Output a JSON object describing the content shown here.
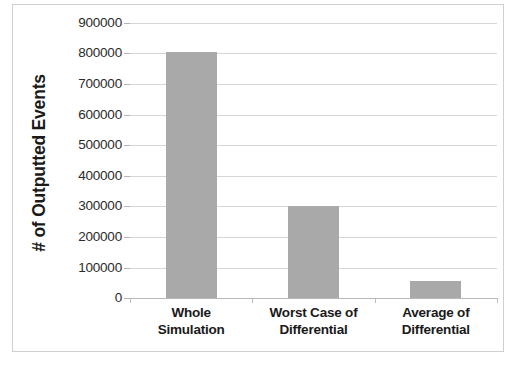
{
  "chart_data": {
    "type": "bar",
    "title": "",
    "xlabel": "",
    "ylabel": "# of Outputted Events",
    "categories": [
      "Whole Simulation",
      "Worst Case of Differential",
      "Average of Differential"
    ],
    "category_lines": [
      [
        "Whole",
        "Simulation"
      ],
      [
        "Worst Case of",
        "Differential"
      ],
      [
        "Average of",
        "Differential"
      ]
    ],
    "values": [
      805000,
      300000,
      57000
    ],
    "series": [
      {
        "name": "# of Outputted Events",
        "values": [
          805000,
          300000,
          57000
        ]
      }
    ],
    "ylim": [
      0,
      900000
    ],
    "ytick_values": [
      0,
      100000,
      200000,
      300000,
      400000,
      500000,
      600000,
      700000,
      800000,
      900000
    ],
    "ytick_labels": [
      "0",
      "100000",
      "200000",
      "300000",
      "400000",
      "500000",
      "600000",
      "700000",
      "800000",
      "900000"
    ],
    "grid": true,
    "legend": false,
    "legend_position": "none",
    "bar_color": "#a9a9a9",
    "gridline_color": "#d6d6d6",
    "axis_color": "#b8b8b8",
    "text_color": "#1a1a1a",
    "plot_background": "#ffffff",
    "border_color": "#cfcfcf"
  }
}
